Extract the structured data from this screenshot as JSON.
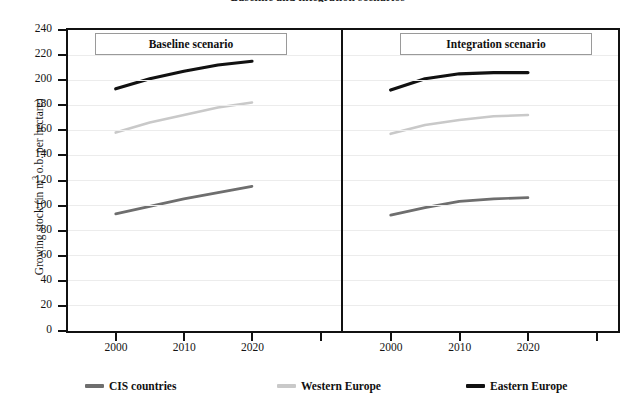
{
  "figure": {
    "title": "Baseline and integration scenarios"
  },
  "axes": {
    "ylabel_prefix": "Growing stock (in m",
    "ylabel_sup": "3",
    "ylabel_suffix": " o.b. per hectare)",
    "y_ticks": [
      0,
      20,
      40,
      60,
      80,
      100,
      120,
      140,
      160,
      180,
      200,
      220,
      240
    ],
    "ymin": 0,
    "ymax": 240,
    "x_ticks": [
      "2000",
      "2010",
      "2020"
    ],
    "grid": true
  },
  "panels": [
    {
      "id": "baseline",
      "label": "Baseline scenario"
    },
    {
      "id": "integration",
      "label": "Integration scenario"
    }
  ],
  "legend": {
    "position": "bottom",
    "items": [
      {
        "label": "CIS countries",
        "color": "#6e6e6e"
      },
      {
        "label": "Western Europe",
        "color": "#c9c9c9"
      },
      {
        "label": "Eastern Europe",
        "color": "#111111"
      }
    ]
  },
  "chart_data": {
    "type": "line",
    "title": "Baseline and integration scenarios",
    "xlabel": "",
    "ylabel": "Growing stock (in m3 o.b. per hectare)",
    "ylim": [
      0,
      240
    ],
    "ytick_step": 20,
    "grid": true,
    "legend_position": "bottom",
    "panels": [
      {
        "name": "Baseline scenario",
        "x": [
          2000,
          2005,
          2010,
          2015,
          2020
        ],
        "series": [
          {
            "name": "CIS countries",
            "color": "#6e6e6e",
            "values": [
              93,
              99,
              105,
              110,
              115
            ]
          },
          {
            "name": "Western Europe",
            "color": "#c9c9c9",
            "values": [
              158,
              166,
              172,
              178,
              182
            ]
          },
          {
            "name": "Eastern Europe",
            "color": "#111111",
            "values": [
              193,
              201,
              207,
              212,
              215
            ]
          }
        ]
      },
      {
        "name": "Integration scenario",
        "x": [
          2000,
          2005,
          2010,
          2015,
          2020
        ],
        "series": [
          {
            "name": "CIS countries",
            "color": "#6e6e6e",
            "values": [
              92,
              98,
              103,
              105,
              106
            ]
          },
          {
            "name": "Western Europe",
            "color": "#c9c9c9",
            "values": [
              157,
              164,
              168,
              171,
              172
            ]
          },
          {
            "name": "Eastern Europe",
            "color": "#111111",
            "values": [
              192,
              201,
              205,
              206,
              206
            ]
          }
        ]
      }
    ]
  }
}
